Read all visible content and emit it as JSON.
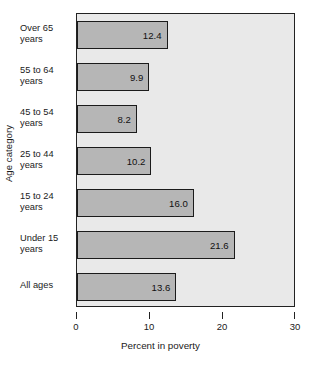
{
  "chart_data": {
    "type": "bar",
    "orientation": "horizontal",
    "title": "",
    "xlabel": "Percent in poverty",
    "ylabel": "Age category",
    "xlim": [
      0,
      30
    ],
    "xticks": [
      0,
      10,
      20,
      30
    ],
    "xtick_labels": [
      "0",
      "10",
      "20",
      "30"
    ],
    "grid": false,
    "legend": null,
    "categories": [
      "Over 65\nyears",
      "55 to 64\nyears",
      "45 to 54\nyears",
      "25 to 44\nyears",
      "15 to 24\nyears",
      "Under 15\nyears",
      "All ages"
    ],
    "values": [
      12.4,
      9.9,
      8.2,
      10.2,
      16.0,
      21.6,
      13.6
    ],
    "value_labels": [
      "12.4",
      "9.9",
      "8.2",
      "10.2",
      "16.0",
      "21.6",
      "13.6"
    ],
    "bars": [
      {
        "category_line1": "Over 65",
        "category_line2": "years",
        "value": 12.4,
        "label": "12.4"
      },
      {
        "category_line1": "55 to 64",
        "category_line2": "years",
        "value": 9.9,
        "label": "9.9"
      },
      {
        "category_line1": "45 to 54",
        "category_line2": "years",
        "value": 8.2,
        "label": "8.2"
      },
      {
        "category_line1": "25 to 44",
        "category_line2": "years",
        "value": 10.2,
        "label": "10.2"
      },
      {
        "category_line1": "15 to 24",
        "category_line2": "years",
        "value": 16.0,
        "label": "16.0"
      },
      {
        "category_line1": "Under 15",
        "category_line2": "years",
        "value": 21.6,
        "label": "21.6"
      },
      {
        "category_line1": "All ages",
        "category_line2": "",
        "value": 13.6,
        "label": "13.6"
      }
    ],
    "colors": {
      "bar_fill": "#b6b6b6",
      "bar_edge": "#1b1b1b",
      "plot_background": "#e9e9e9",
      "axis": "#222222",
      "text": "#1a1a1a",
      "page_background": "#ffffff"
    }
  }
}
